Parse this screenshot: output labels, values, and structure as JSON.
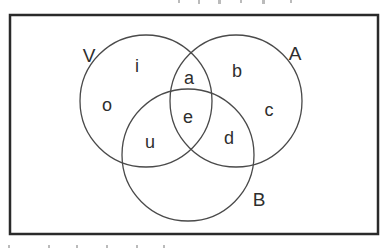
{
  "diagram": {
    "type": "venn",
    "frame": {
      "x": 10,
      "y": 15,
      "width": 368,
      "height": 219
    },
    "sets": [
      {
        "name": "V",
        "label": "V",
        "cx": 146,
        "cy": 101,
        "r": 66,
        "label_x": 89,
        "label_y": 62
      },
      {
        "name": "A",
        "label": "A",
        "cx": 236,
        "cy": 101,
        "r": 66,
        "label_x": 295,
        "label_y": 60
      },
      {
        "name": "B",
        "label": "B",
        "cx": 188,
        "cy": 155,
        "r": 66,
        "label_x": 259,
        "label_y": 206
      }
    ],
    "elements": [
      {
        "label": "i",
        "region": "V only",
        "x": 137,
        "y": 72
      },
      {
        "label": "o",
        "region": "V only",
        "x": 107,
        "y": 111
      },
      {
        "label": "a",
        "region": "V and A",
        "x": 189,
        "y": 84
      },
      {
        "label": "b",
        "region": "A only",
        "x": 237,
        "y": 77
      },
      {
        "label": "c",
        "region": "A only",
        "x": 269,
        "y": 116
      },
      {
        "label": "e",
        "region": "V and A and B",
        "x": 188,
        "y": 123
      },
      {
        "label": "u",
        "region": "V and B",
        "x": 150,
        "y": 148
      },
      {
        "label": "d",
        "region": "A and B",
        "x": 229,
        "y": 144
      }
    ],
    "stroke_color": "#4a4a4a",
    "frame_color": "#2a2a2a"
  }
}
